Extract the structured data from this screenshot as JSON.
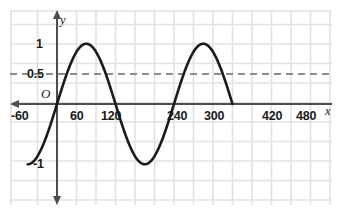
{
  "chart_data": {
    "type": "line",
    "title": "",
    "subtitle": "",
    "xlabel": "x",
    "ylabel": "y",
    "origin_label": "O",
    "xlim": [
      -90,
      555
    ],
    "ylim": [
      -1.45,
      1.5
    ],
    "grid": true,
    "grid_spacing_x": 60,
    "grid_spacing_y": 0.5,
    "legend": "none",
    "x_tick_labels": [
      "-60",
      "60",
      "120",
      "240",
      "300",
      "420",
      "480"
    ],
    "x_tick_values": [
      -60,
      60,
      120,
      240,
      300,
      420,
      480
    ],
    "y_tick_labels": [
      "1",
      "0.5",
      "-1"
    ],
    "y_tick_values": [
      1,
      0.5,
      -1
    ],
    "series": [
      {
        "name": "sine",
        "kind": "curve",
        "equation": "y = sin(x)",
        "amplitude": 1,
        "period": 360,
        "phase": 0,
        "midline": 0,
        "color": "#1a1a1a",
        "x": [
          -90,
          -60,
          -30,
          0,
          30,
          60,
          90,
          120,
          150,
          180,
          210,
          240,
          270,
          300,
          330,
          360,
          390,
          420,
          450,
          480,
          510,
          540
        ],
        "values": [
          -1,
          -0.87,
          -0.5,
          0,
          0.5,
          0.87,
          1,
          0.87,
          0.5,
          0,
          -0.5,
          -0.87,
          -1,
          -0.87,
          -0.5,
          0,
          0.5,
          0.87,
          1,
          0.87,
          0.5,
          0
        ]
      }
    ],
    "annotations": [
      {
        "kind": "horizontal-dashed-line",
        "label": "0.5",
        "y": 0.5,
        "color": "#8c8c8c",
        "style": "dashed"
      }
    ],
    "colors": {
      "curve": "#1a1a1a",
      "axis": "#4d4d4d",
      "grid": "#e2e2e4",
      "dashed_line": "#8c8c8c",
      "text": "#1a1a1a",
      "background": "#ffffff"
    }
  }
}
